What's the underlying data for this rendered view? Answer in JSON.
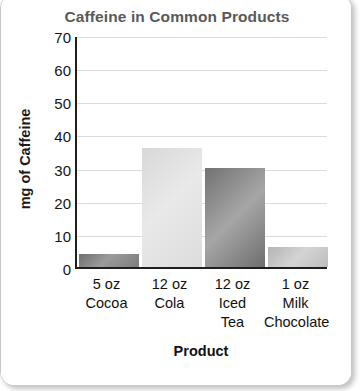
{
  "chart_data": {
    "type": "bar",
    "title": "Caffeine in Common Products",
    "xlabel": "Product",
    "ylabel": "mg of Caffeine",
    "categories": [
      "5 oz Cocoa",
      "12 oz Cola",
      "12 oz Iced Tea",
      "1 oz Milk Chocolate"
    ],
    "category_lines": [
      [
        "5 oz",
        "Cocoa"
      ],
      [
        "12 oz",
        "Cola"
      ],
      [
        "12 oz",
        "Iced",
        "Tea"
      ],
      [
        "1 oz",
        "Milk",
        "Chocolate"
      ]
    ],
    "values": [
      4,
      36,
      30,
      6
    ],
    "ylim": [
      0,
      70
    ],
    "y_ticks": [
      70,
      60,
      50,
      40,
      30,
      20,
      10,
      0
    ],
    "grid": true,
    "legend": "none",
    "bar_colors": [
      "#8a8a8a",
      "#e2e2e2",
      "#8c8c8c",
      "#c6c6c6"
    ]
  },
  "colors": {
    "title": "#595959",
    "axis_text": "#111111",
    "axis_line": "#1f1f1f",
    "gridline": "#dcdcdc",
    "card_border": "#c9c9c9",
    "background": "#ffffff"
  }
}
